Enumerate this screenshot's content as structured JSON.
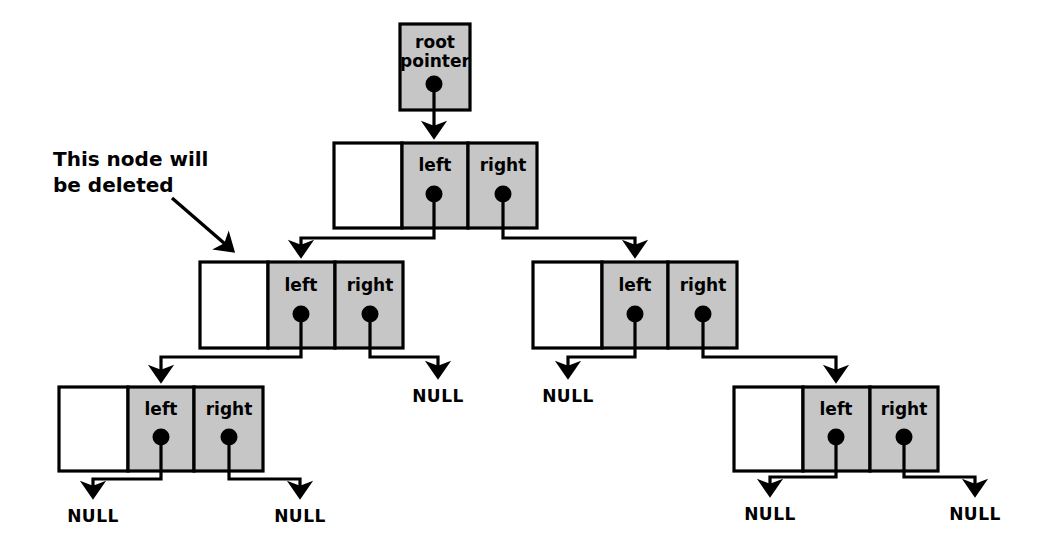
{
  "diagram": {
    "colors": {
      "node_gray": "#c6c6c6",
      "node_white": "#ffffff",
      "stroke": "#000000",
      "background": "#ffffff"
    },
    "annotation": {
      "line1": "This node will",
      "line2": "be deleted"
    },
    "root_pointer": {
      "line1": "root",
      "line2": "pointer"
    },
    "labels": {
      "left": "left",
      "right": "right",
      "null": "NULL"
    },
    "nodes": [
      {
        "id": "root-node",
        "level": 1,
        "data_cell": "",
        "left_label": "left",
        "right_label": "right"
      },
      {
        "id": "left-child-node",
        "level": 2,
        "data_cell": "",
        "left_label": "left",
        "right_label": "right"
      },
      {
        "id": "right-child-node",
        "level": 2,
        "data_cell": "",
        "left_label": "left",
        "right_label": "right"
      },
      {
        "id": "left-grandchild-node",
        "level": 3,
        "data_cell": "",
        "left_label": "left",
        "right_label": "right"
      },
      {
        "id": "right-grandchild-node",
        "level": 3,
        "data_cell": "",
        "left_label": "left",
        "right_label": "right"
      }
    ],
    "null_terminators": [
      {
        "id": "null-left-child-right",
        "label": "NULL"
      },
      {
        "id": "null-right-child-left",
        "label": "NULL"
      },
      {
        "id": "null-left-grandchild-left",
        "label": "NULL"
      },
      {
        "id": "null-left-grandchild-right",
        "label": "NULL"
      },
      {
        "id": "null-right-grandchild-left",
        "label": "NULL"
      },
      {
        "id": "null-right-grandchild-right",
        "label": "NULL"
      }
    ]
  }
}
